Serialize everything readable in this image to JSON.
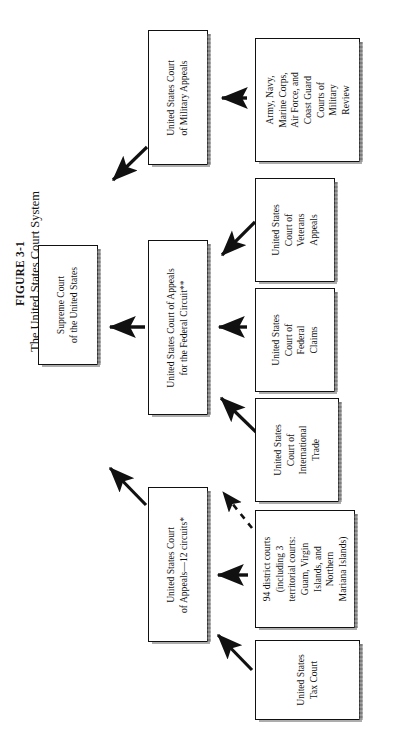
{
  "figure": {
    "number": "FIGURE 3-1",
    "title": "The United States Court System"
  },
  "nodes": {
    "supreme_court": {
      "id": "supreme-court",
      "lines": [
        "Supreme Court",
        "of the United States"
      ]
    },
    "military_appeals": {
      "id": "us-court-of-military-appeals",
      "lines": [
        "United States Court",
        "of Military Appeals"
      ]
    },
    "federal_circuit": {
      "id": "us-court-of-appeals-federal-circuit",
      "lines": [
        "United States Court of Appeals",
        "for the Federal Circuit**"
      ]
    },
    "circuit_courts": {
      "id": "us-court-of-appeals-12-circuits",
      "lines": [
        "United States Court",
        "of Appeals—12 circuits*"
      ]
    },
    "military_review": {
      "id": "service-courts-of-military-review",
      "lines": [
        "Army, Navy,",
        "Marine Corps,",
        "Air Force, and",
        "Coast Guard",
        "Courts of",
        "Military",
        "Review"
      ]
    },
    "veterans_appeals": {
      "id": "us-court-of-veterans-appeals",
      "lines": [
        "United States",
        "Court of",
        "Veterans",
        "Appeals"
      ]
    },
    "federal_claims": {
      "id": "us-court-of-federal-claims",
      "lines": [
        "United States",
        "Court of",
        "Federal",
        "Claims"
      ]
    },
    "international_trade": {
      "id": "us-court-of-international-trade",
      "lines": [
        "United States",
        "Court of",
        "International",
        "Trade"
      ]
    },
    "district_courts": {
      "id": "district-courts",
      "lines": [
        "94 district courts",
        "(including 3",
        "territorial courts:",
        "Guam, Virgin",
        "Islands, and",
        "Northern",
        "Mariana Islands)"
      ]
    },
    "tax_court": {
      "id": "us-tax-court",
      "lines": [
        "United States",
        "Tax Court"
      ]
    }
  },
  "edges": [
    {
      "name": "military-review-to-military-appeals",
      "style": "solid"
    },
    {
      "name": "military-appeals-to-supreme-court",
      "style": "solid"
    },
    {
      "name": "veterans-appeals-to-federal-circuit",
      "style": "solid"
    },
    {
      "name": "federal-claims-to-federal-circuit",
      "style": "solid"
    },
    {
      "name": "international-trade-to-federal-circuit",
      "style": "solid"
    },
    {
      "name": "federal-circuit-to-supreme-court",
      "style": "solid"
    },
    {
      "name": "district-courts-to-federal-circuit",
      "style": "dashed"
    },
    {
      "name": "district-courts-to-circuit-courts",
      "style": "solid"
    },
    {
      "name": "tax-court-to-circuit-courts",
      "style": "solid"
    },
    {
      "name": "circuit-courts-to-supreme-court",
      "style": "solid"
    }
  ],
  "colors": {
    "ink": "#111111",
    "paper": "#ffffff",
    "shadow": "#555555"
  }
}
